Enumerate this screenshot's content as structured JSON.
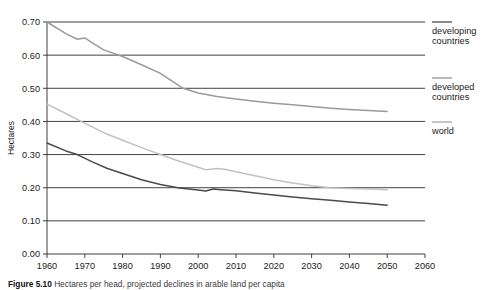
{
  "chart_data": {
    "type": "line",
    "title": "",
    "xlabel": "",
    "ylabel": "Hectares",
    "xlim": [
      1960,
      2060
    ],
    "ylim": [
      0.0,
      0.7
    ],
    "grid": true,
    "legend_position": "right",
    "xticks": [
      "1960",
      "1970",
      "1980",
      "1990",
      "2000",
      "2010",
      "2020",
      "2030",
      "2040",
      "2050",
      "2060"
    ],
    "yticks": [
      "0.00",
      "0.10",
      "0.20",
      "0.30",
      "0.40",
      "0.50",
      "0.60",
      "0.70"
    ],
    "series": [
      {
        "name": "developing countries",
        "color": "#9a9a9a",
        "x": [
          1960,
          1965,
          1968,
          1970,
          1972,
          1975,
          1980,
          1985,
          1990,
          1995,
          1996,
          2000,
          2005,
          2010,
          2015,
          2020,
          2025,
          2030,
          2035,
          2040,
          2045,
          2050
        ],
        "values": [
          0.7,
          0.665,
          0.648,
          0.652,
          0.637,
          0.616,
          0.596,
          0.571,
          0.545,
          0.507,
          0.5,
          0.486,
          0.475,
          0.468,
          0.461,
          0.455,
          0.45,
          0.445,
          0.44,
          0.436,
          0.433,
          0.43
        ]
      },
      {
        "name": "developed countries",
        "color": "#c2c2c2",
        "x": [
          1960,
          1965,
          1969,
          1975,
          1980,
          1985,
          1990,
          1995,
          2000,
          2002,
          2005,
          2007,
          2010,
          2015,
          2020,
          2025,
          2030,
          2035,
          2040,
          2045,
          2050
        ],
        "values": [
          0.452,
          0.424,
          0.4,
          0.366,
          0.343,
          0.321,
          0.3,
          0.28,
          0.262,
          0.254,
          0.258,
          0.256,
          0.248,
          0.236,
          0.224,
          0.214,
          0.206,
          0.2,
          0.198,
          0.196,
          0.194
        ]
      },
      {
        "name": "world",
        "color": "#4a4a4a",
        "x": [
          1960,
          1965,
          1968,
          1972,
          1976,
          1980,
          1985,
          1990,
          1995,
          2000,
          2002,
          2004,
          2006,
          2010,
          2015,
          2020,
          2025,
          2030,
          2035,
          2040,
          2045,
          2050
        ],
        "values": [
          0.335,
          0.311,
          0.3,
          0.278,
          0.258,
          0.243,
          0.224,
          0.21,
          0.199,
          0.193,
          0.19,
          0.196,
          0.194,
          0.191,
          0.184,
          0.178,
          0.172,
          0.167,
          0.162,
          0.157,
          0.152,
          0.147
        ]
      }
    ]
  },
  "axis": {
    "ylabel": "Hectares"
  },
  "legend": {
    "items": [
      {
        "label_line1": "developing",
        "label_line2": "countries",
        "color": "#6e6e6e"
      },
      {
        "label_line1": "developed",
        "label_line2": "countries",
        "color": "#a8a8a8"
      },
      {
        "label_line1": "world",
        "label_line2": "",
        "color": "#b8b8b8"
      }
    ]
  },
  "caption": {
    "label": "Figure 5.10",
    "text": "Hectares per head, projected declines in arable land per capita"
  }
}
